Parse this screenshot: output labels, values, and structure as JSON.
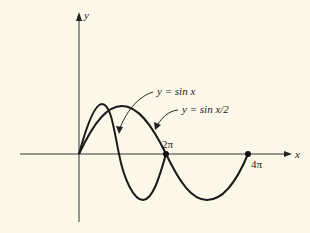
{
  "diagram": {
    "axes": {
      "x_label": "x",
      "y_label": "y"
    },
    "curves": [
      {
        "name": "sin-x",
        "label": "y = sin x"
      },
      {
        "name": "sin-x-half",
        "label": "y = sin x/2"
      }
    ],
    "tick_labels": {
      "two_pi": "2π",
      "four_pi": "4π"
    },
    "colors": {
      "background": "#fcf8e9",
      "ink": "#1a1a1a"
    }
  }
}
